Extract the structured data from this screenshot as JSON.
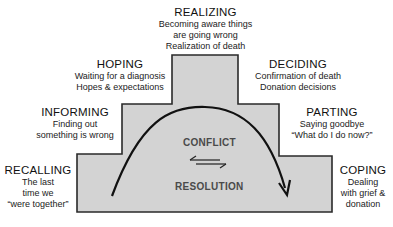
{
  "colors": {
    "fill": "#d3d3d3",
    "stroke": "#2a2a2a",
    "text": "#1a1a1a",
    "center_text": "#4a4a4a"
  },
  "stages": {
    "realizing": {
      "title": "REALIZING",
      "lines": [
        "Becoming aware things",
        "are going wrong",
        "Realization of death"
      ]
    },
    "hoping": {
      "title": "HOPING",
      "lines": [
        "Waiting for a diagnosis",
        "Hopes & expectations"
      ]
    },
    "deciding": {
      "title": "DECIDING",
      "lines": [
        "Confirmation of death",
        "Donation decisions"
      ]
    },
    "informing": {
      "title": "INFORMING",
      "lines": [
        "Finding out",
        "something is wrong"
      ]
    },
    "parting": {
      "title": "PARTING",
      "lines": [
        "Saying goodbye",
        "“What do I do now?”"
      ]
    },
    "recalling": {
      "title": "RECALLING",
      "lines": [
        "The last",
        "time we",
        "“were together”"
      ]
    },
    "coping": {
      "title": "COPING",
      "lines": [
        "Dealing",
        "with grief &",
        "donation"
      ]
    }
  },
  "center": {
    "top": "CONFLICT",
    "bottom": "RESOLUTION",
    "arrows_icon": "left-right-harpoons"
  }
}
